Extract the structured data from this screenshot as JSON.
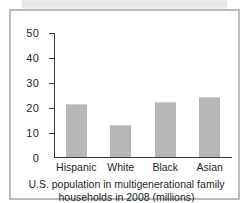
{
  "chart_data": {
    "type": "bar",
    "title": "",
    "caption_line_1": "U.S. population in multigenerational family",
    "caption_line_2": "households in 2008 (millions)",
    "categories": [
      "Hispanic",
      "White",
      "Black",
      "Asian"
    ],
    "values": [
      21.5,
      13.0,
      22.3,
      24.3
    ],
    "xlabel": "",
    "ylabel": "",
    "ylim": [
      0,
      50
    ],
    "ytick_labels": [
      "50",
      "40",
      "30",
      "20",
      "10",
      "0"
    ],
    "ytick_values": [
      50,
      40,
      30,
      20,
      10,
      0
    ],
    "grid": false,
    "legend": null,
    "bar_color": "#b7b7b7",
    "axis_color": "#3a3a3a",
    "text_color": "#221f1f",
    "frame_color": "#b9bcc0"
  }
}
